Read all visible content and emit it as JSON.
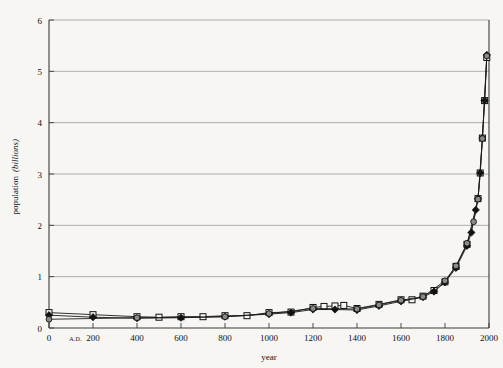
{
  "chart_data": {
    "type": "line",
    "title": "",
    "xlabel": "year",
    "ylabel": "population (billions)",
    "ylabel_main": "population",
    "ylabel_unit": "(billions)",
    "xlim": [
      0,
      2000
    ],
    "ylim": [
      0,
      6
    ],
    "grid": true,
    "legend_position": "none",
    "era_prefix": "A.D.",
    "x_ticks": [
      0,
      200,
      400,
      600,
      800,
      1000,
      1200,
      1400,
      1600,
      1800,
      2000
    ],
    "x_tick_labels": [
      "0",
      "200",
      "400",
      "600",
      "800",
      "1000",
      "1200",
      "1400",
      "1600",
      "1800",
      "2000"
    ],
    "y_ticks": [
      0,
      1,
      2,
      3,
      4,
      5,
      6
    ],
    "y_tick_labels": [
      "0",
      "1",
      "2",
      "3",
      "4",
      "5",
      "6"
    ],
    "colors": {
      "background": "#f7f6f3",
      "gridline": "#9a9a98",
      "frame": "#3a3a38",
      "line": "#1a1a1a",
      "marker_open": "#f7f6f3",
      "marker_filled": "#111111",
      "marker_circle": "#8a8a88"
    },
    "series": [
      {
        "name": "estimate-series-a",
        "marker": "square",
        "x": [
          0,
          200,
          400,
          500,
          600,
          700,
          800,
          900,
          1000,
          1100,
          1200,
          1250,
          1300,
          1340,
          1400,
          1500,
          1600,
          1650,
          1700,
          1750,
          1800,
          1850,
          1900,
          1950,
          1960,
          1970,
          1980,
          1990
        ],
        "values": [
          0.3,
          0.26,
          0.22,
          0.21,
          0.22,
          0.22,
          0.24,
          0.24,
          0.3,
          0.31,
          0.4,
          0.42,
          0.43,
          0.44,
          0.38,
          0.46,
          0.55,
          0.55,
          0.62,
          0.73,
          0.9,
          1.2,
          1.63,
          2.52,
          3.02,
          3.7,
          4.43,
          5.27
        ]
      },
      {
        "name": "estimate-series-b",
        "marker": "diamond",
        "x": [
          0,
          200,
          400,
          600,
          800,
          1000,
          1100,
          1200,
          1300,
          1400,
          1500,
          1600,
          1700,
          1750,
          1800,
          1850,
          1900,
          1920,
          1940,
          1950,
          1960,
          1970,
          1980,
          1990
        ],
        "values": [
          0.25,
          0.21,
          0.19,
          0.2,
          0.22,
          0.27,
          0.3,
          0.36,
          0.36,
          0.35,
          0.43,
          0.52,
          0.6,
          0.71,
          0.89,
          1.17,
          1.6,
          1.86,
          2.3,
          2.52,
          3.02,
          3.7,
          4.43,
          5.32
        ]
      },
      {
        "name": "estimate-series-c",
        "marker": "circle",
        "x": [
          0,
          400,
          800,
          1000,
          1200,
          1400,
          1500,
          1600,
          1700,
          1800,
          1850,
          1900,
          1930,
          1950,
          1970,
          1990
        ],
        "values": [
          0.17,
          0.2,
          0.22,
          0.28,
          0.38,
          0.37,
          0.45,
          0.54,
          0.61,
          0.92,
          1.21,
          1.65,
          2.07,
          2.51,
          3.69,
          5.3
        ]
      }
    ],
    "annotations": []
  }
}
